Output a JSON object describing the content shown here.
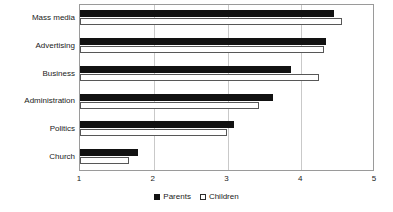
{
  "chart_data": {
    "type": "bar",
    "orientation": "horizontal",
    "title": "",
    "subtitle": "",
    "xlabel": "",
    "ylabel": "",
    "categories": [
      "Mass media",
      "Advertising",
      "Business",
      "Administration",
      "Politics",
      "Church"
    ],
    "series": [
      {
        "name": "Parents",
        "color": "#121212",
        "values": [
          4.45,
          4.34,
          3.86,
          3.62,
          3.09,
          1.79
        ]
      },
      {
        "name": "Children",
        "color": "#ffffff",
        "values": [
          4.55,
          4.31,
          4.24,
          3.43,
          2.99,
          1.66
        ]
      }
    ],
    "xlim": [
      1,
      5
    ],
    "xticks": [
      1,
      2,
      3,
      4,
      5
    ],
    "xtick_labels": [
      "1",
      "2",
      "3",
      "4",
      "5"
    ],
    "grid": true,
    "grid_axis": "x",
    "legend": [
      "Parents",
      "Children"
    ],
    "legend_position": "bottom-center"
  },
  "legend": {
    "items": [
      {
        "label": "Parents",
        "swatch": "filled-square-icon"
      },
      {
        "label": "Children",
        "swatch": "outlined-square-icon"
      }
    ]
  }
}
